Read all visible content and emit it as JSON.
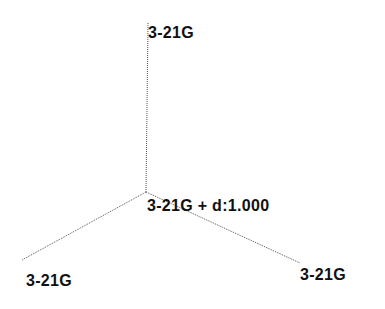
{
  "diagram": {
    "type": "molecular-basis-set-tree",
    "center_atom": {
      "label": "3-21G + d:1.000",
      "x": 146,
      "y": 192
    },
    "atoms": [
      {
        "label": "3-21G",
        "position": "top",
        "x": 148,
        "y": 22
      },
      {
        "label": "3-21G",
        "position": "bottom-left",
        "x": 22,
        "y": 260
      },
      {
        "label": "3-21G",
        "position": "bottom-right",
        "x": 300,
        "y": 263
      }
    ],
    "bond_color": "#555555",
    "label_color": "#111111"
  }
}
